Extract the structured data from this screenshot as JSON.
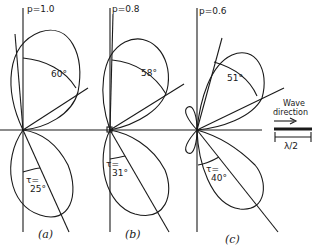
{
  "panels": [
    {
      "id": "a",
      "p_label": "p=1.0",
      "upper_angle": "60°",
      "tau_label": "τ=",
      "tau_value": "25°",
      "caption": "(a)"
    },
    {
      "id": "b",
      "p_label": "p=0.8",
      "upper_angle": "58°",
      "tau_label": "τ=",
      "tau_value": "31°",
      "caption": "(b)"
    },
    {
      "id": "c",
      "p_label": "p=0.6",
      "upper_angle": "51°",
      "tau_label": "τ=",
      "tau_value": "40°",
      "caption": "(c)"
    }
  ],
  "legend": {
    "title_line1": "Wave",
    "title_line2": "direction",
    "arrow": "→",
    "scale_label": "λ/2"
  },
  "colors": {
    "ink": "#1a1a1a",
    "background": "#ffffff"
  }
}
